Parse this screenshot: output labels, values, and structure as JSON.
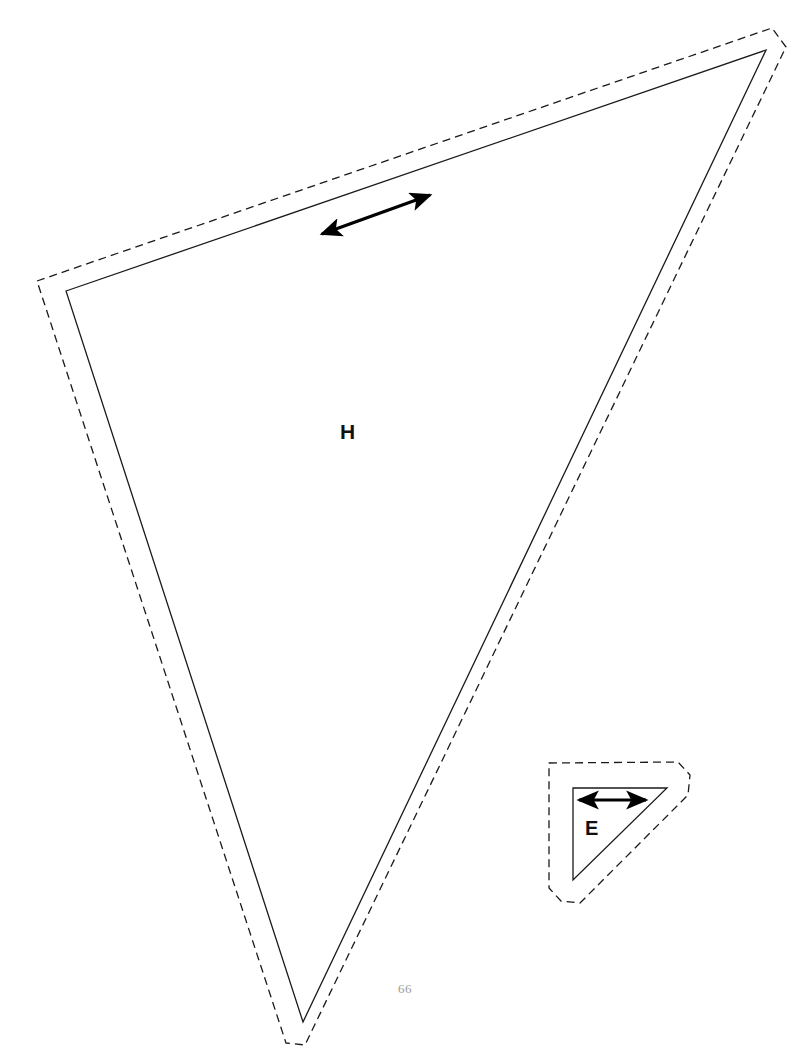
{
  "page": {
    "width": 810,
    "height": 1057,
    "background_color": "#ffffff",
    "page_number": "66",
    "page_number_color": "#9a9a9a",
    "document_type": "sewing-pattern-template-sheet"
  },
  "line_styles": {
    "cut_line_color": "#1a1a1a",
    "cut_line_width": 1.3,
    "seam_line_color": "#1a1a1a",
    "seam_line_width": 1.3,
    "seam_dash_pattern": "8 5",
    "grainline_color": "#000000",
    "grainline_width": 3.2
  },
  "pieces": [
    {
      "id": "piece-h",
      "label": "H",
      "label_position": {
        "x": 350,
        "y": 434
      },
      "shape": "triangle",
      "cut_line_points": "66,291 766,50 303,1022",
      "seam_line_points": "37,281 772,28 786,47 305,1045 286,1043",
      "grainline": {
        "x1": 322,
        "y1": 234,
        "x2": 430,
        "y2": 195,
        "double_headed": true
      }
    },
    {
      "id": "piece-e",
      "label": "E",
      "label_position": {
        "x": 595,
        "y": 831
      },
      "shape": "triangle",
      "cut_line_points": "573,788 667,788 573,880",
      "seam_line_points": "549,763 678,762 690,775 688,795 580,903 561,901 549,888",
      "grainline": {
        "x1": 579,
        "y1": 800,
        "x2": 646,
        "y2": 800,
        "double_headed": true
      }
    }
  ],
  "legend": {
    "solid_line_meaning": "cutting line",
    "dashed_line_meaning": "seam allowance line",
    "arrow_meaning": "grainline"
  }
}
